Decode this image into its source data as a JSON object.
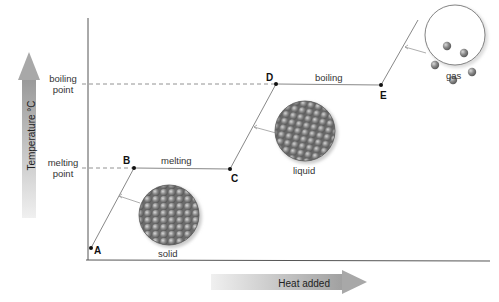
{
  "diagram": {
    "y_axis_label": "Temperature °C",
    "x_axis_label": "Heat added",
    "y_ticks": [
      {
        "label_line1": "boiling",
        "label_line2": "point"
      },
      {
        "label_line1": "melting",
        "label_line2": "point"
      }
    ],
    "points": [
      {
        "id": "A",
        "label": "A"
      },
      {
        "id": "B",
        "label": "B"
      },
      {
        "id": "C",
        "label": "C"
      },
      {
        "id": "D",
        "label": "D"
      },
      {
        "id": "E",
        "label": "E"
      }
    ],
    "segment_labels": {
      "melting": "melting",
      "boiling": "boiling"
    },
    "states": [
      {
        "name": "solid",
        "label": "solid"
      },
      {
        "name": "liquid",
        "label": "liquid"
      },
      {
        "name": "gas",
        "label": "gas"
      }
    ],
    "colors": {
      "line": "#888888",
      "axis": "#555555",
      "arrow_fill": "#b0b0b0",
      "particle": "#7a7a7a"
    }
  }
}
